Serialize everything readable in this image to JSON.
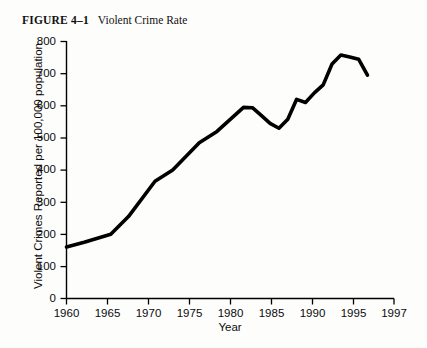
{
  "figure": {
    "label": "FIGURE 4–1",
    "title": "Violent Crime Rate"
  },
  "chart_data": {
    "type": "line",
    "title": "Violent Crime Rate",
    "xlabel": "Year",
    "ylabel": "Violent Crimes Reported per 100,000  population",
    "xlim": [
      1960,
      1997
    ],
    "ylim": [
      0,
      800
    ],
    "xticks": [
      "1960",
      "1965",
      "1970",
      "1975",
      "1980",
      "1985",
      "1990",
      "1995",
      "1997"
    ],
    "yticks": [
      "0",
      "100",
      "200",
      "300",
      "400",
      "500",
      "600",
      "700",
      "800"
    ],
    "grid": false,
    "legend": "none",
    "series": [
      {
        "name": "Violent crimes reported per 100,000 population",
        "color": "#000000",
        "x": [
          1960,
          1962,
          1965,
          1967,
          1970,
          1972,
          1975,
          1977,
          1980,
          1981,
          1982,
          1983,
          1984,
          1985,
          1986,
          1987,
          1988,
          1989,
          1990,
          1991,
          1992,
          1993,
          1994
        ],
        "values": [
          160,
          175,
          200,
          255,
          365,
          400,
          485,
          520,
          595,
          594,
          570,
          545,
          530,
          558,
          620,
          610,
          640,
          665,
          730,
          758,
          752,
          745,
          695
        ]
      }
    ]
  },
  "axis": {
    "tick_color": "#000000",
    "line_color": "#000000"
  }
}
